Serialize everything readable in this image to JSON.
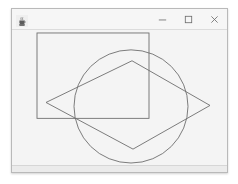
{
  "window": {
    "title": "",
    "icon": "java-coffee-cup-icon",
    "frame": {
      "x": 11,
      "y": 8,
      "width": 217,
      "height": 165
    },
    "background_color": "#f1f1f1",
    "border_color": "#b9b9b9"
  },
  "titlebar": {
    "background_color": "#f6f6f6",
    "controls": [
      {
        "name": "minimize-button",
        "label": "–",
        "glyph": "minimize-icon"
      },
      {
        "name": "maximize-button",
        "label": "□",
        "glyph": "maximize-icon"
      },
      {
        "name": "close-button",
        "label": "×",
        "glyph": "close-icon"
      }
    ]
  },
  "canvas": {
    "background_color": "#f4f4f4",
    "stroke_color": "#6e6e6e",
    "stroke_width": 0.9,
    "viewbox": {
      "width": 215,
      "height": 136
    },
    "shapes": [
      {
        "name": "rectangle-shape",
        "type": "rect",
        "x": 25,
        "y": 3,
        "width": 112,
        "height": 86,
        "stroke": "#6e6e6e",
        "fill": "none"
      },
      {
        "name": "circle-shape",
        "type": "circle",
        "cx": 119,
        "cy": 77,
        "r": 57,
        "stroke": "#6e6e6e",
        "fill": "none"
      },
      {
        "name": "quadrilateral-shape",
        "type": "polygon",
        "points": "34,73 120,31 198,76 121,120",
        "stroke": "#6e6e6e",
        "fill": "none"
      }
    ]
  },
  "status_strip": {
    "background_color": "#ebebeb"
  }
}
